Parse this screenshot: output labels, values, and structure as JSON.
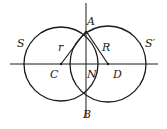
{
  "diagram": {
    "stroke_color": "#1a1a1a",
    "background": "#ffffff",
    "circles": [
      {
        "name": "S",
        "cx": 61,
        "cy": 64,
        "r": 37
      },
      {
        "name": "S'",
        "cx": 108,
        "cy": 64,
        "r": 38
      }
    ],
    "labels": {
      "S": "S",
      "S_prime": "S′",
      "A": "A",
      "B": "B",
      "C": "C",
      "D": "D",
      "N": "N",
      "r": "r",
      "R": "R"
    }
  }
}
